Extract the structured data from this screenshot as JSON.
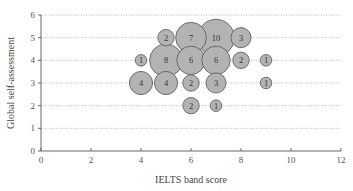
{
  "chart_data": {
    "type": "scatter",
    "subtype": "bubble",
    "title": "",
    "xlabel": "IELTS band score",
    "ylabel": "Global self-assessment",
    "xlim": [
      0,
      12
    ],
    "ylim": [
      0,
      6
    ],
    "x_ticks": [
      0,
      2,
      4,
      6,
      8,
      10,
      12
    ],
    "y_ticks": [
      0,
      1,
      2,
      3,
      4,
      5,
      6
    ],
    "grid": "horizontal dotted",
    "legend": "none",
    "bubble_color": "#b3b3b3",
    "bubble_stroke": "#555555",
    "points": [
      {
        "x": 5,
        "y": 5,
        "count": 2
      },
      {
        "x": 6,
        "y": 5,
        "count": 7
      },
      {
        "x": 7,
        "y": 5,
        "count": 10
      },
      {
        "x": 8,
        "y": 5,
        "count": 3
      },
      {
        "x": 4,
        "y": 4,
        "count": 1
      },
      {
        "x": 5,
        "y": 4,
        "count": 8
      },
      {
        "x": 6,
        "y": 4,
        "count": 6
      },
      {
        "x": 7,
        "y": 4,
        "count": 6
      },
      {
        "x": 8,
        "y": 4,
        "count": 2
      },
      {
        "x": 9,
        "y": 4,
        "count": 1
      },
      {
        "x": 4,
        "y": 3,
        "count": 4
      },
      {
        "x": 5,
        "y": 3,
        "count": 4
      },
      {
        "x": 6,
        "y": 3,
        "count": 2
      },
      {
        "x": 7,
        "y": 3,
        "count": 3
      },
      {
        "x": 9,
        "y": 3,
        "count": 1
      },
      {
        "x": 6,
        "y": 2,
        "count": 2
      },
      {
        "x": 7,
        "y": 2,
        "count": 1
      }
    ]
  }
}
